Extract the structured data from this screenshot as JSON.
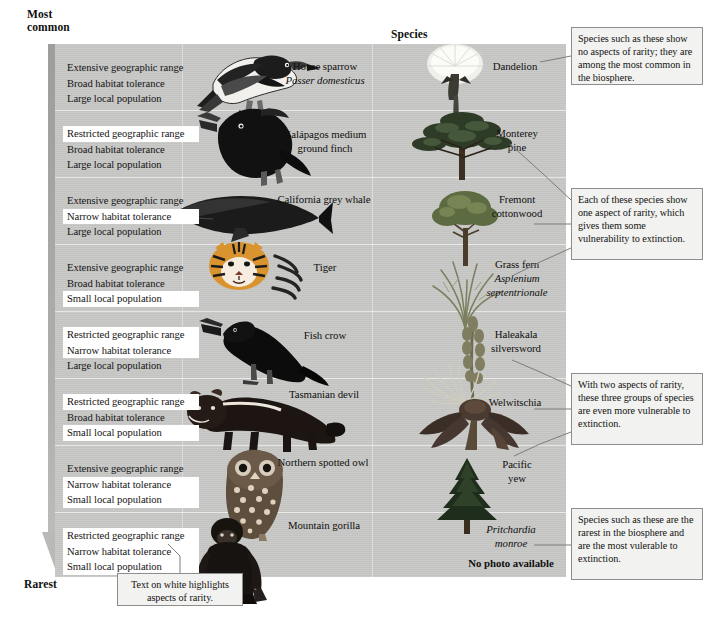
{
  "axis": {
    "top_label": "Most\ncommon",
    "top_label_line1": "Most",
    "top_label_line2": "common",
    "bottom_label": "Rarest",
    "arrow_name": "rarity-gradient-arrow"
  },
  "header": {
    "species_column_label": "Species"
  },
  "rarity_rows": [
    {
      "index": 1,
      "attributes": [
        {
          "text": "Extensive geographic range",
          "highlighted": false
        },
        {
          "text": "Broad habitat tolerance",
          "highlighted": false
        },
        {
          "text": "Large local population",
          "highlighted": false
        }
      ],
      "animal": {
        "common_name": "House sparrow",
        "scientific_name": "Passer domesticus",
        "icon": "sparrow-illustration"
      },
      "plant": {
        "common_name": "Dandelion",
        "scientific_name": "",
        "icon": "dandelion-illustration"
      }
    },
    {
      "index": 2,
      "attributes": [
        {
          "text": "Restricted geographic range",
          "highlighted": true
        },
        {
          "text": "Broad habitat tolerance",
          "highlighted": false
        },
        {
          "text": "Large local population",
          "highlighted": false
        }
      ],
      "animal": {
        "common_name": "Galápagos medium\nground finch",
        "common_name_line1": "Galápagos medium",
        "common_name_line2": "ground finch",
        "scientific_name": "",
        "icon": "finch-illustration"
      },
      "plant": {
        "common_name": "Monterey\npine",
        "common_name_line1": "Monterey",
        "common_name_line2": "pine",
        "scientific_name": "",
        "icon": "pine-illustration"
      }
    },
    {
      "index": 3,
      "attributes": [
        {
          "text": "Extensive geographic range",
          "highlighted": false
        },
        {
          "text": "Narrow habitat tolerance",
          "highlighted": true
        },
        {
          "text": "Large local population",
          "highlighted": false
        }
      ],
      "animal": {
        "common_name": "California grey whale",
        "scientific_name": "",
        "icon": "whale-illustration"
      },
      "plant": {
        "common_name": "Fremont\ncottonwood",
        "common_name_line1": "Fremont",
        "common_name_line2": "cottonwood",
        "scientific_name": "",
        "icon": "cottonwood-illustration"
      }
    },
    {
      "index": 4,
      "attributes": [
        {
          "text": "Extensive geographic range",
          "highlighted": false
        },
        {
          "text": "Broad habitat tolerance",
          "highlighted": false
        },
        {
          "text": "Small local population",
          "highlighted": true
        }
      ],
      "animal": {
        "common_name": "Tiger",
        "scientific_name": "",
        "icon": "tiger-illustration"
      },
      "plant": {
        "common_name": "Grass fern",
        "scientific_name_line1": "Asplenium",
        "scientific_name_line2": "septentrionale",
        "icon": "grass-fern-illustration"
      }
    },
    {
      "index": 5,
      "attributes": [
        {
          "text": "Restricted geographic range",
          "highlighted": true
        },
        {
          "text": "Narrow habitat tolerance",
          "highlighted": true
        },
        {
          "text": "Large local population",
          "highlighted": false
        }
      ],
      "animal": {
        "common_name": "Fish crow",
        "scientific_name": "",
        "icon": "crow-illustration"
      },
      "plant": {
        "common_name": "Haleakala\nsilversword",
        "common_name_line1": "Haleakala",
        "common_name_line2": "silversword",
        "scientific_name": "",
        "icon": "silversword-illustration"
      }
    },
    {
      "index": 6,
      "attributes": [
        {
          "text": "Restricted geographic range",
          "highlighted": true
        },
        {
          "text": "Broad habitat tolerance",
          "highlighted": false
        },
        {
          "text": "Small local population",
          "highlighted": true
        }
      ],
      "animal": {
        "common_name": "Tasmanian devil",
        "scientific_name": "",
        "icon": "tasmanian-devil-illustration"
      },
      "plant": {
        "common_name": "Welwitschia",
        "scientific_name": "",
        "icon": "welwitschia-illustration"
      }
    },
    {
      "index": 7,
      "attributes": [
        {
          "text": "Extensive geographic range",
          "highlighted": false
        },
        {
          "text": "Narrow habitat tolerance",
          "highlighted": true
        },
        {
          "text": "Small local population",
          "highlighted": true
        }
      ],
      "animal": {
        "common_name": "Northern spotted owl",
        "scientific_name": "",
        "icon": "owl-illustration"
      },
      "plant": {
        "common_name": "Pacific\nyew",
        "common_name_line1": "Pacific",
        "common_name_line2": "yew",
        "scientific_name": "",
        "icon": "yew-illustration"
      }
    },
    {
      "index": 8,
      "attributes": [
        {
          "text": "Restricted geographic range",
          "highlighted": true
        },
        {
          "text": "Narrow habitat tolerance",
          "highlighted": true
        },
        {
          "text": "Small local population",
          "highlighted": true
        }
      ],
      "animal": {
        "common_name": "Mountain gorilla",
        "scientific_name": "",
        "icon": "gorilla-illustration"
      },
      "plant": {
        "common_name": "",
        "scientific_name_line1": "Pritchardia",
        "scientific_name_line2": "monroe",
        "no_photo_text": "No photo available",
        "icon": "no-photo-placeholder"
      }
    }
  ],
  "callouts": {
    "top_right": "Species such as these show no aspects of rarity; they are among the most common in the biosphere.",
    "middle_right": "Each of these species show one aspect of rarity, which gives them some vulnerability to extinction.",
    "lower_right": "With two aspects of rarity, these three groups of species are even more vulnerable to extinction.",
    "bottom_right": "Species such as these are the rarest in the biosphere and are the most vulerable to extinction.",
    "bottom_left": "Text on white highlights aspects of rarity."
  },
  "colors": {
    "panel_background": "#c8c8c6",
    "highlight": "#ffffff",
    "arrow": "#a8a8a6",
    "callout_background": "#f2f2f0",
    "callout_border": "#8d8d8d",
    "text": "#121212"
  }
}
